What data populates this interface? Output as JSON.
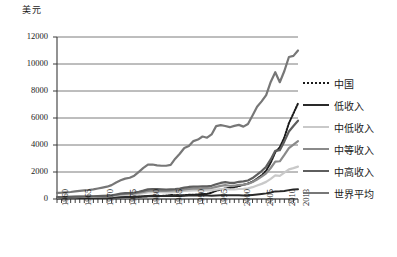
{
  "chart_data": {
    "type": "line",
    "title": "",
    "ylabel": "美元",
    "xlabel": "",
    "ylim": [
      0,
      12000
    ],
    "ytick_labels": [
      "12000",
      "10000",
      "8000",
      "6000",
      "4000",
      "2000",
      "0"
    ],
    "ytick_values": [
      12000,
      10000,
      8000,
      6000,
      4000,
      2000,
      0
    ],
    "grid": true,
    "legend_position": "right",
    "x_start": 1960,
    "x_end": 2013,
    "xtick_labels": [
      "1960",
      "1965",
      "1970",
      "1975",
      "1980",
      "1985",
      "1990",
      "1995",
      "2000",
      "2005",
      "2010",
      "2013"
    ],
    "xtick_values": [
      1960,
      1965,
      1970,
      1975,
      1980,
      1985,
      1990,
      1995,
      2000,
      2005,
      2010,
      2013
    ],
    "x": [
      1960,
      1961,
      1962,
      1963,
      1964,
      1965,
      1966,
      1967,
      1968,
      1969,
      1970,
      1971,
      1972,
      1973,
      1974,
      1975,
      1976,
      1977,
      1978,
      1979,
      1980,
      1981,
      1982,
      1983,
      1984,
      1985,
      1986,
      1987,
      1988,
      1989,
      1990,
      1991,
      1992,
      1993,
      1994,
      1995,
      1996,
      1997,
      1998,
      1999,
      2000,
      2001,
      2002,
      2003,
      2004,
      2005,
      2006,
      2007,
      2008,
      2009,
      2010,
      2011,
      2012,
      2013
    ],
    "series": [
      {
        "name": "中国",
        "color": "#1b1b1b",
        "style": "dotted",
        "width": 2.0,
        "values": [
          90,
          75,
          70,
          74,
          85,
          98,
          104,
          96,
          92,
          100,
          113,
          118,
          131,
          157,
          160,
          178,
          165,
          185,
          156,
          184,
          195,
          197,
          203,
          225,
          250,
          294,
          282,
          251,
          283,
          310,
          318,
          333,
          366,
          377,
          473,
          610,
          709,
          781,
          828,
          873,
          959,
          1053,
          1149,
          1288,
          1509,
          1753,
          2099,
          2694,
          3468,
          3832,
          4561,
          5618,
          6338,
          7077
        ]
      },
      {
        "name": "低收入",
        "color": "#2a2a2a",
        "style": "solid",
        "width": 2.0,
        "values": [
          60,
          62,
          64,
          67,
          69,
          72,
          75,
          74,
          78,
          83,
          88,
          92,
          99,
          118,
          135,
          146,
          148,
          157,
          177,
          196,
          225,
          232,
          228,
          224,
          217,
          213,
          215,
          222,
          240,
          253,
          258,
          259,
          258,
          252,
          248,
          258,
          272,
          277,
          277,
          273,
          271,
          266,
          272,
          300,
          334,
          375,
          417,
          479,
          563,
          569,
          599,
          658,
          706,
          713
        ]
      },
      {
        "name": "中低收入",
        "color": "#c9c9c9",
        "style": "solid",
        "width": 2.2,
        "values": [
          125,
          128,
          131,
          136,
          141,
          148,
          149,
          155,
          163,
          175,
          188,
          196,
          207,
          245,
          290,
          311,
          316,
          338,
          381,
          436,
          493,
          513,
          511,
          503,
          494,
          496,
          511,
          551,
          598,
          623,
          642,
          636,
          650,
          631,
          644,
          696,
          742,
          757,
          712,
          704,
          742,
          752,
          789,
          875,
          995,
          1120,
          1268,
          1495,
          1746,
          1718,
          1953,
          2197,
          2290,
          2398
        ]
      },
      {
        "name": "中等收入",
        "color": "#8a8a8a",
        "style": "solid",
        "width": 2.2,
        "values": [
          138,
          142,
          145,
          152,
          160,
          169,
          172,
          177,
          186,
          199,
          215,
          226,
          244,
          296,
          350,
          382,
          388,
          411,
          462,
          530,
          606,
          627,
          618,
          607,
          601,
          611,
          629,
          664,
          718,
          752,
          774,
          775,
          795,
          782,
          812,
          898,
          975,
          1023,
          983,
          984,
          1041,
          1062,
          1116,
          1254,
          1450,
          1655,
          1896,
          2296,
          2763,
          2795,
          3261,
          3764,
          4031,
          4283
        ]
      },
      {
        "name": "中高收入",
        "color": "#5e5e5e",
        "style": "solid",
        "width": 2.2,
        "values": [
          145,
          149,
          153,
          160,
          170,
          181,
          186,
          192,
          203,
          219,
          238,
          251,
          274,
          336,
          400,
          440,
          448,
          476,
          538,
          621,
          716,
          742,
          729,
          713,
          705,
          719,
          739,
          779,
          846,
          891,
          917,
          920,
          945,
          934,
          977,
          1088,
          1190,
          1254,
          1198,
          1196,
          1275,
          1303,
          1372,
          1550,
          1800,
          2071,
          2393,
          2931,
          3570,
          3616,
          4268,
          5003,
          5412,
          5800
        ]
      },
      {
        "name": "世界平均",
        "color": "#777777",
        "style": "solid",
        "width": 2.2,
        "values": [
          450,
          466,
          490,
          519,
          560,
          600,
          637,
          667,
          711,
          775,
          844,
          912,
          1030,
          1226,
          1382,
          1508,
          1573,
          1727,
          2014,
          2300,
          2540,
          2555,
          2488,
          2463,
          2462,
          2532,
          2985,
          3354,
          3775,
          3920,
          4290,
          4403,
          4627,
          4540,
          4780,
          5400,
          5470,
          5410,
          5320,
          5420,
          5490,
          5360,
          5560,
          6180,
          6830,
          7230,
          7700,
          8670,
          9390,
          8650,
          9480,
          10520,
          10600,
          11000
        ]
      }
    ]
  },
  "legend": {
    "items": [
      {
        "label": "中国",
        "color": "#1b1b1b"
      },
      {
        "label": "低收入",
        "color": "#2a2a2a"
      },
      {
        "label": "中低收入",
        "color": "#c9c9c9"
      },
      {
        "label": "中等收入",
        "color": "#8a8a8a"
      },
      {
        "label": "中高收入",
        "color": "#5e5e5e"
      },
      {
        "label": "世界平均",
        "color": "#777777"
      }
    ]
  }
}
